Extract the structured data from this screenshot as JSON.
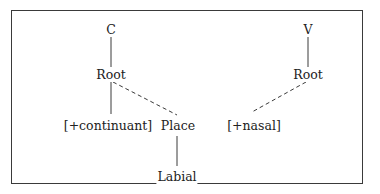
{
  "diagram": {
    "type": "feature-geometry-tree",
    "left_tree": {
      "segment": "C",
      "root": "Root",
      "feature": "[+continuant]",
      "place": "Place",
      "articulator": "Labial"
    },
    "right_tree": {
      "segment": "V",
      "root": "Root",
      "feature": "[+nasal]"
    },
    "edges": [
      {
        "from": "C",
        "to": "Root (left)",
        "style": "solid"
      },
      {
        "from": "Root (left)",
        "to": "[+continuant]",
        "style": "solid"
      },
      {
        "from": "Root (left)",
        "to": "Place",
        "style": "dashed"
      },
      {
        "from": "Place",
        "to": "Labial",
        "style": "solid"
      },
      {
        "from": "V",
        "to": "Root (right)",
        "style": "solid"
      },
      {
        "from": "Root (right)",
        "to": "[+nasal]",
        "style": "dashed"
      }
    ],
    "colors": {
      "line": "#3a3a3a",
      "text": "#222222",
      "background": "#ffffff"
    }
  }
}
